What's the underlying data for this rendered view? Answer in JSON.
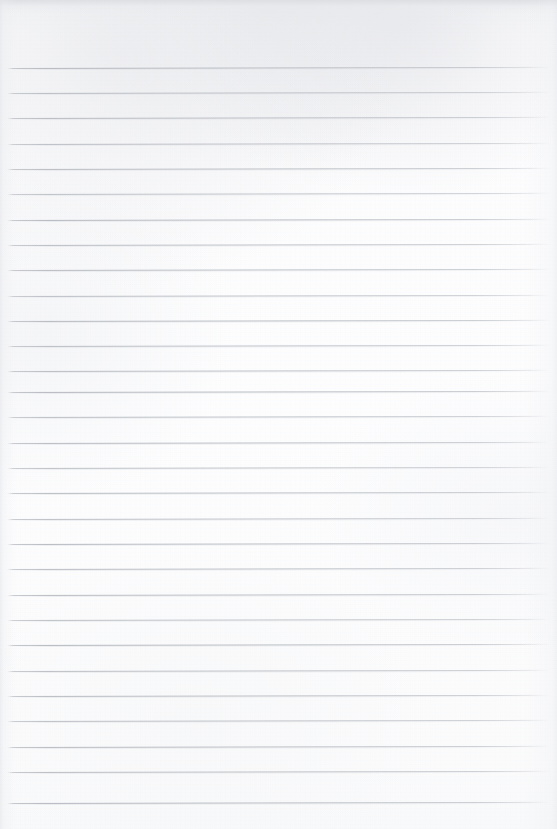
{
  "document": {
    "kind": "lined-paper-scan",
    "title": "Blank Ruled Notebook Page",
    "page_width": 557,
    "page_height": 829,
    "text_content": "",
    "has_handwriting": false,
    "has_printed_text": false,
    "has_margin_line": false,
    "has_punch_holes": false
  },
  "colors": {
    "paper": "#fcfcfd",
    "paper_top_band": "#dbdde1",
    "rule_line": "#b0b4bb",
    "rule_shadow": "#d6d9dd",
    "edge_shade": "#e2e4e8"
  },
  "ruling": {
    "style": "wide-ruled horizontal lines",
    "line_count": 30,
    "first_line_y": 68,
    "last_line_y": 803,
    "line_spacing": 25.34,
    "line_thickness": 1,
    "line_start_x": 7,
    "line_end_x": 551,
    "tilt_degrees": -0.12,
    "header_blank_height": 68,
    "footer_blank_height": 26,
    "lines": [
      {
        "index": 1,
        "y": 68,
        "x1": 7,
        "x2": 551,
        "opacity": 0.95
      },
      {
        "index": 2,
        "y": 93,
        "x1": 7,
        "x2": 551,
        "opacity": 0.88
      },
      {
        "index": 3,
        "y": 118,
        "x1": 7,
        "x2": 551,
        "opacity": 0.92
      },
      {
        "index": 4,
        "y": 144,
        "x1": 7,
        "x2": 551,
        "opacity": 0.86
      },
      {
        "index": 5,
        "y": 169,
        "x1": 7,
        "x2": 551,
        "opacity": 0.9
      },
      {
        "index": 6,
        "y": 194,
        "x1": 7,
        "x2": 551,
        "opacity": 0.83
      },
      {
        "index": 7,
        "y": 220,
        "x1": 7,
        "x2": 551,
        "opacity": 0.94
      },
      {
        "index": 8,
        "y": 245,
        "x1": 7,
        "x2": 551,
        "opacity": 0.87
      },
      {
        "index": 9,
        "y": 270,
        "x1": 7,
        "x2": 551,
        "opacity": 0.91
      },
      {
        "index": 10,
        "y": 296,
        "x1": 7,
        "x2": 551,
        "opacity": 0.85
      },
      {
        "index": 11,
        "y": 321,
        "x1": 7,
        "x2": 551,
        "opacity": 0.93
      },
      {
        "index": 12,
        "y": 346,
        "x1": 7,
        "x2": 551,
        "opacity": 0.88
      },
      {
        "index": 13,
        "y": 371,
        "x1": 7,
        "x2": 551,
        "opacity": 0.9
      },
      {
        "index": 14,
        "y": 392,
        "x1": 7,
        "x2": 551,
        "opacity": 0.95
      },
      {
        "index": 15,
        "y": 417,
        "x1": 7,
        "x2": 551,
        "opacity": 0.86
      },
      {
        "index": 16,
        "y": 443,
        "x1": 7,
        "x2": 551,
        "opacity": 0.92
      },
      {
        "index": 17,
        "y": 468,
        "x1": 7,
        "x2": 551,
        "opacity": 0.84
      },
      {
        "index": 18,
        "y": 493,
        "x1": 7,
        "x2": 551,
        "opacity": 0.9
      },
      {
        "index": 19,
        "y": 519,
        "x1": 7,
        "x2": 551,
        "opacity": 0.87
      },
      {
        "index": 20,
        "y": 544,
        "x1": 7,
        "x2": 551,
        "opacity": 0.93
      },
      {
        "index": 21,
        "y": 569,
        "x1": 7,
        "x2": 551,
        "opacity": 0.89
      },
      {
        "index": 22,
        "y": 595,
        "x1": 7,
        "x2": 551,
        "opacity": 0.91
      },
      {
        "index": 23,
        "y": 620,
        "x1": 7,
        "x2": 551,
        "opacity": 0.85
      },
      {
        "index": 24,
        "y": 645,
        "x1": 7,
        "x2": 551,
        "opacity": 0.94
      },
      {
        "index": 25,
        "y": 671,
        "x1": 7,
        "x2": 551,
        "opacity": 0.88
      },
      {
        "index": 26,
        "y": 696,
        "x1": 7,
        "x2": 551,
        "opacity": 0.9
      },
      {
        "index": 27,
        "y": 721,
        "x1": 7,
        "x2": 551,
        "opacity": 0.86
      },
      {
        "index": 28,
        "y": 747,
        "x1": 7,
        "x2": 551,
        "opacity": 0.92
      },
      {
        "index": 29,
        "y": 772,
        "x1": 7,
        "x2": 551,
        "opacity": 0.89
      },
      {
        "index": 30,
        "y": 803,
        "x1": 7,
        "x2": 551,
        "opacity": 0.95
      }
    ]
  }
}
